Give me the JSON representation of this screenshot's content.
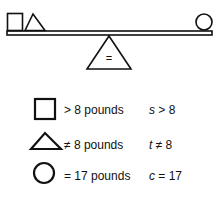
{
  "diagram": {
    "fulcrum_symbol": "=",
    "left_side": [
      "square",
      "triangle"
    ],
    "right_side": [
      "circle"
    ]
  },
  "legend": [
    {
      "shape": "square",
      "label": "> 8 pounds",
      "var": "s",
      "rel": " > 8"
    },
    {
      "shape": "triangle",
      "label": "≠ 8 pounds",
      "var": "t",
      "rel": " ≠ 8"
    },
    {
      "shape": "circle",
      "label": "= 17 pounds",
      "var": "c",
      "rel": " = 17"
    }
  ]
}
